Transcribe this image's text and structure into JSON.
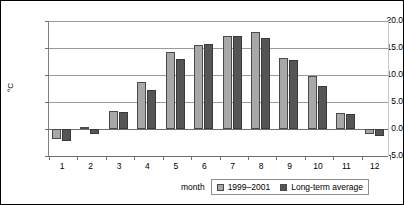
{
  "chart_data": {
    "type": "bar",
    "title": "",
    "xlabel": "month",
    "ylabel": "°C",
    "categories": [
      "1",
      "2",
      "3",
      "4",
      "5",
      "6",
      "7",
      "8",
      "9",
      "10",
      "11",
      "12"
    ],
    "ylim": [
      -5.0,
      20.0
    ],
    "yticks": [
      -5.0,
      0.0,
      5.0,
      10.0,
      15.0,
      20.0
    ],
    "ytick_labels": [
      "-5.0",
      "0.0",
      "5.0",
      "10.0",
      "15.0",
      "20.0"
    ],
    "grid": true,
    "legend_position": "bottom-right",
    "series": [
      {
        "name": "1999–2001",
        "color": "#a8a8a8",
        "values": [
          -1.8,
          0.3,
          3.4,
          8.7,
          14.3,
          15.6,
          17.2,
          18.0,
          13.2,
          9.9,
          2.9,
          -1.0
        ]
      },
      {
        "name": "Long-term average",
        "color": "#555555",
        "values": [
          -2.3,
          -1.0,
          3.1,
          7.2,
          13.0,
          15.8,
          17.3,
          16.9,
          12.8,
          8.0,
          2.7,
          -1.3
        ]
      }
    ]
  },
  "axes": {
    "y_title": "°C",
    "x_title": "month"
  },
  "legend": {
    "entries": [
      {
        "label": "1999–2001",
        "color": "#a8a8a8"
      },
      {
        "label": "Long-term average",
        "color": "#555555"
      }
    ]
  }
}
